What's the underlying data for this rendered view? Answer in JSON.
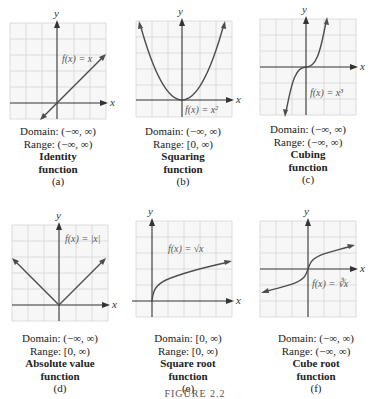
{
  "figure": {
    "footer_label": "FIGURE 2.2",
    "colors": {
      "grid": "#d6d6d6",
      "grid_background": "#f7f7f7",
      "axis": "#333333",
      "curve": "#4d4d4d",
      "text": "#222222"
    },
    "panels": [
      {
        "id": "a",
        "equation": "f(x) = x",
        "domain": "Domain: (−∞, ∞)",
        "range": "Range: (−∞, ∞)",
        "name_line1": "Identity",
        "name_line2": "function",
        "letter": "(a)",
        "x_axis_label": "x",
        "y_axis_label": "y"
      },
      {
        "id": "b",
        "equation": "f(x) = x²",
        "domain": "Domain: (−∞, ∞)",
        "range": "Range: [0, ∞)",
        "name_line1": "Squaring",
        "name_line2": "function",
        "letter": "(b)",
        "x_axis_label": "x",
        "y_axis_label": "y"
      },
      {
        "id": "c",
        "equation": "f(x) = x³",
        "domain": "Domain: (−∞, ∞)",
        "range": "Range: (−∞, ∞)",
        "name_line1": "Cubing",
        "name_line2": "function",
        "letter": "(c)",
        "x_axis_label": "x",
        "y_axis_label": "y"
      },
      {
        "id": "d",
        "equation": "f(x) = |x|",
        "domain": "Domain: (−∞, ∞)",
        "range": "Range: [0, ∞)",
        "name_line1": "Absolute value",
        "name_line2": "function",
        "letter": "(d)",
        "x_axis_label": "x",
        "y_axis_label": "y"
      },
      {
        "id": "e",
        "equation": "f(x) = √x",
        "domain": "Domain: [0, ∞)",
        "range": "Range: [0, ∞)",
        "name_line1": "Square root",
        "name_line2": "function",
        "letter": "(e)",
        "x_axis_label": "x",
        "y_axis_label": "y"
      },
      {
        "id": "f",
        "equation": "f(x) = ∛x",
        "domain": "Domain: (−∞, ∞)",
        "range": "Range: (−∞, ∞)",
        "name_line1": "Cube root",
        "name_line2": "function",
        "letter": "(f)",
        "x_axis_label": "x",
        "y_axis_label": "y"
      }
    ]
  }
}
